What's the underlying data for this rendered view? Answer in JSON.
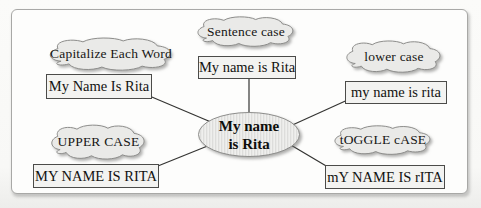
{
  "diagram": {
    "center": {
      "line1": "My name",
      "line2": "is Rita"
    },
    "nodes": [
      {
        "style_label": "Capitalize Each Word",
        "example": "My Name Is Rita"
      },
      {
        "style_label": "Sentence case",
        "example": "My name is Rita"
      },
      {
        "style_label": "lower case",
        "example": "my name is rita"
      },
      {
        "style_label": "UPPER CASE",
        "example": "MY NAME IS RITA"
      },
      {
        "style_label": "tOGGLE cASE",
        "example": "mY NAME IS rITA"
      }
    ],
    "colors": {
      "cloud_fill": "#eaeae8",
      "cloud_stroke": "#8d8d8b",
      "box_fill": "#f3f3f1",
      "box_border": "#4b4b49",
      "ellipse_stripe_light": "#efefed",
      "ellipse_stripe_dark": "#dddddb",
      "connector": "#343432",
      "text": "#141412",
      "frame_border": "#a8a8a6",
      "frame_fill": "#fdfdfc"
    }
  }
}
